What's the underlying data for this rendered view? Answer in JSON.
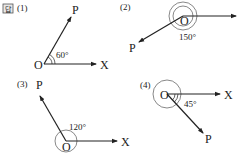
{
  "answer_badge": "답",
  "panels": [
    {
      "number": "(1)",
      "angle": "60°",
      "vertex": "O",
      "ray_x": "X",
      "ray_p": "P"
    },
    {
      "number": "(2)",
      "angle": "150°",
      "vertex": "O",
      "ray_x": "",
      "ray_p": "P"
    },
    {
      "number": "(3)",
      "angle": "120°",
      "vertex": "O",
      "ray_x": "X",
      "ray_p": "P"
    },
    {
      "number": "(4)",
      "angle": "45°",
      "vertex": "O",
      "ray_x": "X",
      "ray_p": "P"
    }
  ],
  "colors": {
    "line": "#222222",
    "circle": "#555555"
  }
}
